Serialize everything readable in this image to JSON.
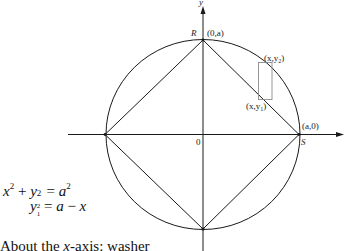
{
  "diagram": {
    "axes": {
      "x_label": "",
      "y_label": "y",
      "origin_label": "0"
    },
    "points": {
      "R": {
        "name": "R",
        "coords": "(0,a)"
      },
      "S": {
        "name": "S",
        "coords": "(a,0)"
      }
    },
    "slice": {
      "top_label_prefix": "(x,y",
      "top_label_sub": "2",
      "top_label_suffix": ")",
      "bottom_label_prefix": "(x,y",
      "bottom_label_sub": "1",
      "bottom_label_suffix": ")"
    },
    "colors": {
      "line": "#1a1a1a",
      "slice": "#8a8a8a",
      "background": "#ffffff"
    }
  },
  "equations": {
    "eq1": {
      "lhs_a": "x",
      "lhs_a_sup": "2",
      "plus": "+",
      "lhs_b": "y",
      "lhs_b_sub": "2",
      "lhs_b_sup": "2",
      "equals": "=",
      "rhs": "a",
      "rhs_sup": "2"
    },
    "eq2": {
      "lhs": "y",
      "lhs_sub": "1",
      "equals": "=",
      "rhs_a": "a",
      "minus": "−",
      "rhs_b": "x"
    }
  },
  "caption": {
    "prefix": "About the ",
    "axis": "x",
    "suffix": "-axis: washer"
  }
}
